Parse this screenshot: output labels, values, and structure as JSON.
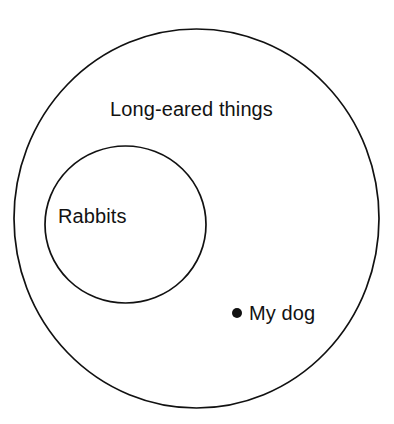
{
  "diagram": {
    "type": "euler-diagram",
    "title": "Long-eared things",
    "background_color": "#ffffff",
    "stroke_color": "#111111",
    "text_color": "#121212",
    "outer_set": {
      "label": "Long-eared things",
      "shape": "circle",
      "cx": 196.5,
      "cy": 218.5,
      "rx": 182.5,
      "ry": 189.5,
      "stroke_width": 1.7,
      "fill": "none"
    },
    "inner_set": {
      "label": "Rabbits",
      "shape": "circle",
      "cx": 125.5,
      "cy": 224.5,
      "rx": 80.5,
      "ry": 78.5,
      "stroke_width": 1.7,
      "fill": "none",
      "relation": "subset-of-outer"
    },
    "elements": [
      {
        "label": "My dog",
        "marker": "filled-dot",
        "marker_color": "#111111",
        "x": 240,
        "y": 315,
        "member_of": "Long-eared things",
        "not_member_of": "Rabbits"
      }
    ]
  }
}
